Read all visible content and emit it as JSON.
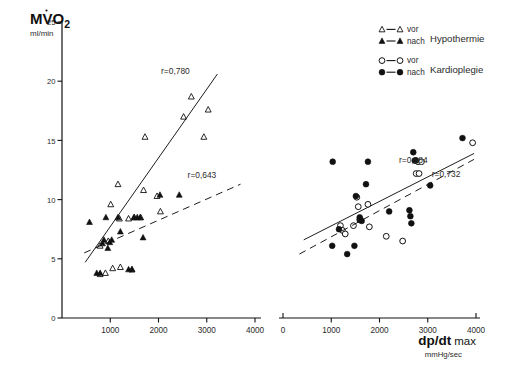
{
  "figure": {
    "caption": "",
    "legend": {
      "entries": [
        {
          "marker": "open-triangle",
          "line": "solid",
          "label": "vor",
          "group": "Hypothermie"
        },
        {
          "marker": "filled-triangle",
          "line": "solid",
          "label": "nach",
          "group": "Hypothermie"
        },
        {
          "marker": "open-circle",
          "line": "solid",
          "label": "vor",
          "group": "Kardioplegie"
        },
        {
          "marker": "filled-circle",
          "line": "solid",
          "label": "nach",
          "group": "Kardioplegie"
        }
      ],
      "group_labels": [
        "Hypothermie",
        "Kardioplegie"
      ]
    }
  },
  "chart_data": [
    {
      "id": "left-panel",
      "type": "scatter",
      "title": "",
      "ylabel": "MVO2",
      "yunit": "ml/min",
      "xlabel": "",
      "xunit": "",
      "xlim": [
        0,
        4000
      ],
      "ylim": [
        0,
        25
      ],
      "xticks": [
        0,
        1000,
        2000,
        3000,
        4000
      ],
      "xticklabels": [
        "",
        "1000",
        "2000",
        "3000",
        "4000"
      ],
      "yticks": [
        0,
        5,
        10,
        15,
        20,
        25
      ],
      "yticklabels": [
        "0",
        "5",
        "10",
        "15",
        "20",
        "25"
      ],
      "grid": false,
      "legend_position": "outside-top-right",
      "annotations": [
        {
          "text": "r=0,780",
          "x": 2350,
          "y": 20.6
        },
        {
          "text": "r=0,643",
          "x": 2900,
          "y": 11.8
        }
      ],
      "series": [
        {
          "name": "vor",
          "group": "Hypothermie",
          "marker": "open-triangle",
          "fit_line": "solid",
          "fit_r": 0.78,
          "fit_from": [
            480,
            4.7
          ],
          "fit_to": [
            3220,
            20.6
          ],
          "points": [
            [
              790,
              3.7
            ],
            [
              900,
              3.8
            ],
            [
              1050,
              4.2
            ],
            [
              1210,
              4.3
            ],
            [
              1450,
              4.1
            ],
            [
              790,
              6.1
            ],
            [
              960,
              6.5
            ],
            [
              1010,
              9.6
            ],
            [
              1160,
              11.3
            ],
            [
              1190,
              8.4
            ],
            [
              1380,
              8.4
            ],
            [
              1500,
              8.5
            ],
            [
              1630,
              8.5
            ],
            [
              1690,
              10.8
            ],
            [
              1720,
              15.3
            ],
            [
              1970,
              10.3
            ],
            [
              2040,
              9.0
            ],
            [
              2520,
              17.0
            ],
            [
              2680,
              18.7
            ],
            [
              2940,
              15.3
            ],
            [
              3030,
              17.6
            ]
          ]
        },
        {
          "name": "nach",
          "group": "Hypothermie",
          "marker": "filled-triangle",
          "fit_line": "dashed",
          "fit_r": 0.643,
          "fit_from": [
            460,
            5.5
          ],
          "fit_to": [
            3700,
            11.3
          ],
          "points": [
            [
              570,
              8.1
            ],
            [
              720,
              3.8
            ],
            [
              790,
              3.8
            ],
            [
              840,
              6.3
            ],
            [
              870,
              6.6
            ],
            [
              910,
              8.5
            ],
            [
              950,
              5.9
            ],
            [
              990,
              6.4
            ],
            [
              1030,
              6.6
            ],
            [
              1160,
              8.5
            ],
            [
              1210,
              7.3
            ],
            [
              1380,
              4.1
            ],
            [
              1450,
              4.1
            ],
            [
              1490,
              8.5
            ],
            [
              1560,
              8.5
            ],
            [
              1620,
              8.5
            ],
            [
              1680,
              6.8
            ],
            [
              2030,
              10.4
            ],
            [
              2430,
              10.4
            ]
          ]
        }
      ]
    },
    {
      "id": "right-panel",
      "type": "scatter",
      "title": "",
      "ylabel": "",
      "yunit": "",
      "xlabel": "dp/dt max",
      "xunit": "mmHg/sec",
      "xlim": [
        0,
        4000
      ],
      "ylim": [
        0,
        25
      ],
      "xticks": [
        0,
        1000,
        2000,
        3000,
        4000
      ],
      "xticklabels": [
        "0",
        "1000",
        "2000",
        "3000",
        "4000"
      ],
      "grid": false,
      "annotations": [
        {
          "text": "r=0,584",
          "x": 2700,
          "y": 13.1
        },
        {
          "text": "r=0,732",
          "x": 3380,
          "y": 11.9
        }
      ],
      "series": [
        {
          "name": "vor",
          "group": "Kardioplegie",
          "marker": "open-circle",
          "fit_line": "solid",
          "fit_r": 0.584,
          "fit_from": [
            430,
            6.6
          ],
          "fit_to": [
            3960,
            13.9
          ],
          "points": [
            [
              1190,
              7.8
            ],
            [
              1230,
              7.4
            ],
            [
              1290,
              7.1
            ],
            [
              1460,
              7.8
            ],
            [
              1530,
              10.2
            ],
            [
              1560,
              9.4
            ],
            [
              1590,
              8.3
            ],
            [
              1760,
              9.6
            ],
            [
              1790,
              7.7
            ],
            [
              2140,
              6.9
            ],
            [
              2800,
              13.2
            ],
            [
              2870,
              13.2
            ],
            [
              2760,
              12.2
            ],
            [
              2820,
              12.2
            ],
            [
              2480,
              6.5
            ],
            [
              3930,
              14.8
            ]
          ]
        },
        {
          "name": "nach",
          "group": "Kardioplegie",
          "marker": "filled-circle",
          "fit_line": "dashed",
          "fit_r": 0.732,
          "fit_from": [
            340,
            5.4
          ],
          "fit_to": [
            3960,
            13.4
          ],
          "points": [
            [
              1030,
              13.2
            ],
            [
              1020,
              6.1
            ],
            [
              1160,
              7.5
            ],
            [
              1330,
              5.4
            ],
            [
              1480,
              6.1
            ],
            [
              1510,
              10.3
            ],
            [
              1590,
              8.5
            ],
            [
              1600,
              8.3
            ],
            [
              1630,
              8.2
            ],
            [
              1720,
              11.3
            ],
            [
              1760,
              13.2
            ],
            [
              2200,
              9.0
            ],
            [
              2700,
              14.0
            ],
            [
              2750,
              13.3
            ],
            [
              2620,
              9.1
            ],
            [
              2640,
              8.6
            ],
            [
              2660,
              8.0
            ],
            [
              3050,
              11.2
            ],
            [
              3720,
              15.2
            ],
            [
              2730,
              13.3
            ]
          ]
        }
      ]
    }
  ]
}
